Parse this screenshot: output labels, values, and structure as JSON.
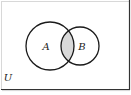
{
  "diagram": {
    "type": "venn",
    "universe_label": "U",
    "sets": [
      {
        "label": "A",
        "cx": 50,
        "cy": 46,
        "r": 24
      },
      {
        "label": "B",
        "cx": 80,
        "cy": 46,
        "r": 19
      }
    ],
    "shaded_region": "A ∩ B",
    "colors": {
      "stroke": "#1a1a1a",
      "shade": "#d9d9d9",
      "frame_dark": "#333333",
      "frame_light": "#d8d8d8",
      "background": "#ffffff"
    }
  }
}
